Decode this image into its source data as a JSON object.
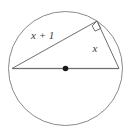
{
  "figure": {
    "kind": "geometry-diagram",
    "background_color": "#ffffff",
    "width": 128,
    "height": 129
  },
  "colors": {
    "circle_stroke": "#8a8a8a",
    "triangle_stroke": "#6e6e6e",
    "diameter_stroke": "#b4b4b4",
    "center_dot": "#1a1a1a",
    "right_angle_stroke": "#6e6e6e",
    "label_text": "#3a3a3a"
  },
  "circle": {
    "name": "circle",
    "center_x": 65.5,
    "center_y": 68.5,
    "radius": 57,
    "stroke_width": 1
  },
  "center_point": {
    "name": "center-dot",
    "x": 65.5,
    "y": 68.5,
    "radius": 2.8
  },
  "diameter": {
    "name": "diameter-segment",
    "x1": 12,
    "y1": 68.5,
    "x2": 119,
    "y2": 68.5,
    "stroke_width": 1.4
  },
  "triangle": {
    "name": "inscribed-right-triangle",
    "vertices": [
      {
        "name": "left-vertex",
        "x": 12,
        "y": 68.5
      },
      {
        "name": "apex-vertex",
        "x": 97,
        "y": 21
      },
      {
        "name": "right-vertex",
        "x": 119,
        "y": 68.5
      }
    ],
    "points_attr": "12,68.5 97,21 119,68.5",
    "stroke_width": 1
  },
  "right_angle_marker": {
    "name": "right-angle-square",
    "points_attr": "92.1,25.9 95.0,31.1 100.8,28.4 97.0,21.0",
    "stroke_width": 1
  },
  "labels": {
    "hypotenuse_leg": {
      "text": "x + 1",
      "x": 31,
      "y": 36.5,
      "anchor": "start"
    },
    "short_leg": {
      "text": "x",
      "x": 95,
      "y": 49,
      "anchor": "middle"
    }
  }
}
